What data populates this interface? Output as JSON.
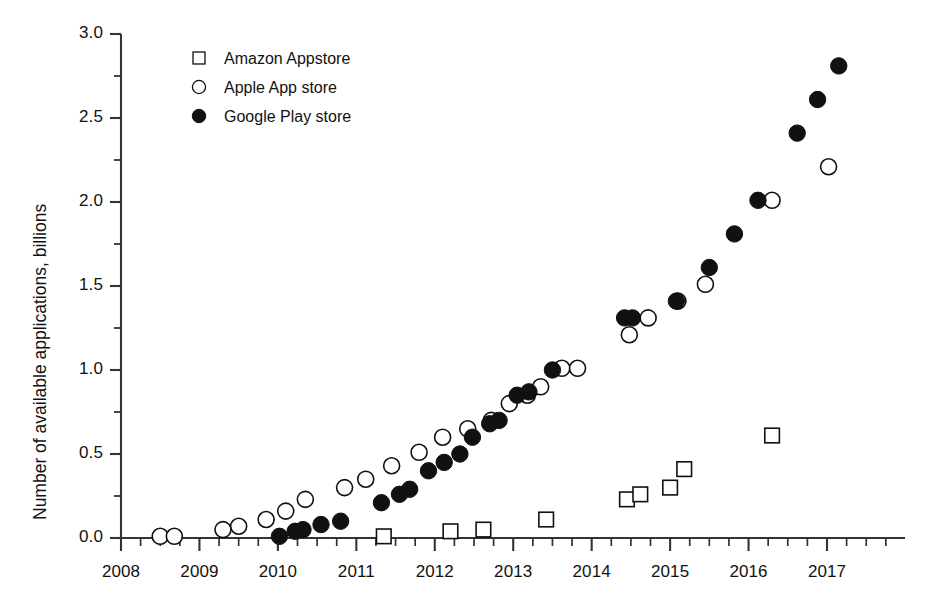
{
  "chart_data": {
    "type": "scatter",
    "title": "",
    "xlabel": "",
    "ylabel": "Number of available applications, billions",
    "xlim": [
      2008.0,
      2017.6
    ],
    "ylim": [
      0.0,
      3.0
    ],
    "grid": false,
    "legend_position": "top-left-inside",
    "x_ticks": [
      "2008",
      "2009",
      "2010",
      "2011",
      "2012",
      "2013",
      "2014",
      "2015",
      "2016",
      "2017"
    ],
    "x_tick_values": [
      2008,
      2009,
      2010,
      2011,
      2012,
      2013,
      2014,
      2015,
      2016,
      2017
    ],
    "x_minor_tick_interval": 0.25,
    "y_ticks": [
      "0.0",
      "0.5",
      "1.0",
      "1.5",
      "2.0",
      "2.5",
      "3.0"
    ],
    "y_tick_values": [
      0.0,
      0.5,
      1.0,
      1.5,
      2.0,
      2.5,
      3.0
    ],
    "y_minor_tick_interval": 0.25,
    "marker_color_filled": "#111111",
    "marker_color_open": "#ffffff",
    "marker_stroke": "#111111",
    "axis_color": "#333333",
    "series": [
      {
        "name": "Amazon Appstore",
        "marker": "open-square",
        "points": [
          {
            "x": 2011.35,
            "y": 0.01
          },
          {
            "x": 2012.2,
            "y": 0.04
          },
          {
            "x": 2012.62,
            "y": 0.05
          },
          {
            "x": 2013.42,
            "y": 0.11
          },
          {
            "x": 2014.45,
            "y": 0.23
          },
          {
            "x": 2014.62,
            "y": 0.26
          },
          {
            "x": 2015.0,
            "y": 0.3
          },
          {
            "x": 2015.18,
            "y": 0.41
          },
          {
            "x": 2016.3,
            "y": 0.61
          }
        ]
      },
      {
        "name": "Apple App store",
        "marker": "open-circle",
        "points": [
          {
            "x": 2008.5,
            "y": 0.01
          },
          {
            "x": 2008.68,
            "y": 0.01
          },
          {
            "x": 2009.3,
            "y": 0.05
          },
          {
            "x": 2009.5,
            "y": 0.07
          },
          {
            "x": 2009.85,
            "y": 0.11
          },
          {
            "x": 2010.1,
            "y": 0.16
          },
          {
            "x": 2010.35,
            "y": 0.23
          },
          {
            "x": 2010.85,
            "y": 0.3
          },
          {
            "x": 2011.12,
            "y": 0.35
          },
          {
            "x": 2011.45,
            "y": 0.43
          },
          {
            "x": 2011.8,
            "y": 0.51
          },
          {
            "x": 2012.1,
            "y": 0.6
          },
          {
            "x": 2012.42,
            "y": 0.65
          },
          {
            "x": 2012.72,
            "y": 0.7
          },
          {
            "x": 2012.95,
            "y": 0.8
          },
          {
            "x": 2013.18,
            "y": 0.85
          },
          {
            "x": 2013.35,
            "y": 0.9
          },
          {
            "x": 2013.62,
            "y": 1.01
          },
          {
            "x": 2013.82,
            "y": 1.01
          },
          {
            "x": 2014.48,
            "y": 1.21
          },
          {
            "x": 2014.72,
            "y": 1.31
          },
          {
            "x": 2015.1,
            "y": 1.41
          },
          {
            "x": 2015.45,
            "y": 1.51
          },
          {
            "x": 2016.3,
            "y": 2.01
          },
          {
            "x": 2017.02,
            "y": 2.21
          }
        ]
      },
      {
        "name": "Google Play store",
        "marker": "filled-circle",
        "points": [
          {
            "x": 2010.02,
            "y": 0.01
          },
          {
            "x": 2010.22,
            "y": 0.04
          },
          {
            "x": 2010.32,
            "y": 0.05
          },
          {
            "x": 2010.55,
            "y": 0.08
          },
          {
            "x": 2010.8,
            "y": 0.1
          },
          {
            "x": 2011.32,
            "y": 0.21
          },
          {
            "x": 2011.55,
            "y": 0.26
          },
          {
            "x": 2011.68,
            "y": 0.29
          },
          {
            "x": 2011.92,
            "y": 0.4
          },
          {
            "x": 2012.12,
            "y": 0.45
          },
          {
            "x": 2012.32,
            "y": 0.5
          },
          {
            "x": 2012.48,
            "y": 0.6
          },
          {
            "x": 2012.7,
            "y": 0.68
          },
          {
            "x": 2012.82,
            "y": 0.7
          },
          {
            "x": 2013.05,
            "y": 0.85
          },
          {
            "x": 2013.2,
            "y": 0.87
          },
          {
            "x": 2013.5,
            "y": 1.0
          },
          {
            "x": 2014.42,
            "y": 1.31
          },
          {
            "x": 2014.52,
            "y": 1.31
          },
          {
            "x": 2015.08,
            "y": 1.41
          },
          {
            "x": 2015.5,
            "y": 1.61
          },
          {
            "x": 2015.82,
            "y": 1.81
          },
          {
            "x": 2016.12,
            "y": 2.01
          },
          {
            "x": 2016.62,
            "y": 2.41
          },
          {
            "x": 2016.88,
            "y": 2.61
          },
          {
            "x": 2017.15,
            "y": 2.81
          }
        ]
      }
    ]
  },
  "legend": {
    "items": [
      {
        "label": "Amazon Appstore",
        "marker": "open-square"
      },
      {
        "label": "Apple App store",
        "marker": "open-circle"
      },
      {
        "label": "Google Play store",
        "marker": "filled-circle"
      }
    ]
  },
  "axes": {
    "y_axis_title": "Number of available applications, billions"
  }
}
